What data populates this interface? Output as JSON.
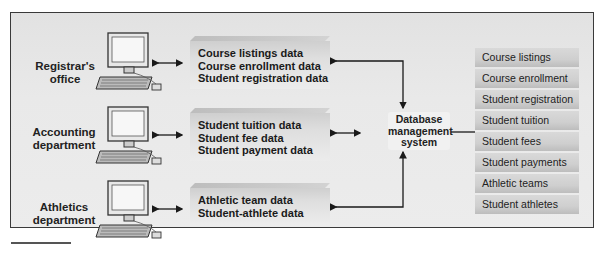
{
  "departments": [
    {
      "name": "Registrar's office",
      "lines": [
        "Registrar's",
        "office"
      ]
    },
    {
      "name": "Accounting department",
      "lines": [
        "Accounting",
        "department"
      ]
    },
    {
      "name": "Athletics department",
      "lines": [
        "Athletics",
        "department"
      ]
    }
  ],
  "data_groups": [
    {
      "lines": [
        "Course listings data",
        "Course enrollment data",
        "Student registration data"
      ]
    },
    {
      "lines": [
        "Student tuition data",
        "Student fee data",
        "Student payment data"
      ]
    },
    {
      "lines": [
        "Athletic team data",
        "Student-athlete data"
      ]
    }
  ],
  "dbms": {
    "lines": [
      "Database",
      "management",
      "system"
    ]
  },
  "database_tables": [
    "Course listings",
    "Course enrollment",
    "Student registration",
    "Student tuition",
    "Student fees",
    "Student payments",
    "Athletic teams",
    "Student athletes"
  ],
  "colors": {
    "frame_border": "#3a3a3a",
    "background": "#e6e6e6",
    "arrow": "#1a1a1a"
  }
}
